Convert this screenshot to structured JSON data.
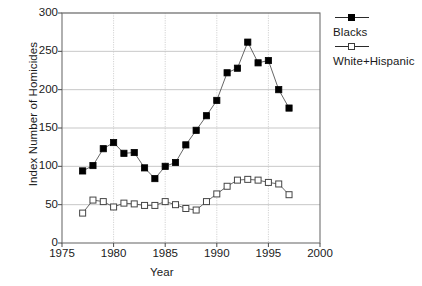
{
  "chart_data": {
    "type": "line",
    "title": "",
    "xlabel": "Year",
    "ylabel": "Index Number of Homicides",
    "xlim": [
      1975,
      2000
    ],
    "ylim": [
      0,
      300
    ],
    "xticks": [
      1975,
      1980,
      1985,
      1990,
      1995,
      2000
    ],
    "xtick_labels": [
      "1975",
      "1980",
      "1985",
      "1990",
      "1995",
      "2000"
    ],
    "yticks": [
      0,
      50,
      100,
      150,
      200,
      250,
      300
    ],
    "ytick_labels": [
      "0",
      "50",
      "100",
      "150",
      "200",
      "250",
      "300"
    ],
    "grid": true,
    "legend_position": "right",
    "x": [
      1977,
      1978,
      1979,
      1980,
      1981,
      1982,
      1983,
      1984,
      1985,
      1986,
      1987,
      1988,
      1989,
      1990,
      1991,
      1992,
      1993,
      1994,
      1995,
      1996,
      1997
    ],
    "series": [
      {
        "name": "Blacks",
        "marker": "filled-square",
        "color": "#000000",
        "values": [
          94,
          101,
          123,
          131,
          117,
          118,
          98,
          84,
          100,
          105,
          128,
          147,
          166,
          186,
          222,
          228,
          262,
          235,
          238,
          200,
          176
        ]
      },
      {
        "name": "White+Hispanic",
        "marker": "open-square",
        "color": "#3a3a3a",
        "values": [
          39,
          56,
          54,
          47,
          52,
          51,
          49,
          49,
          54,
          50,
          45,
          43,
          54,
          64,
          74,
          82,
          83,
          82,
          79,
          77,
          63
        ]
      }
    ]
  },
  "axis": {
    "y_title": "Index Number of Homicides",
    "x_title": "Year"
  },
  "legend": {
    "entries": [
      {
        "label": "Blacks",
        "marker": "filled-square"
      },
      {
        "label": "White+Hispanic",
        "marker": "open-square"
      }
    ]
  },
  "caption": {
    "text": ""
  }
}
